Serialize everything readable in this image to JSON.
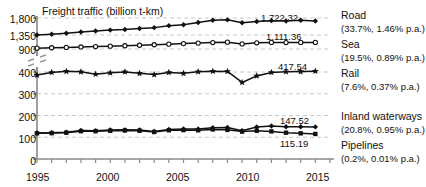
{
  "chart_data": {
    "type": "line",
    "title": "Freight traffic (billion t-km)",
    "xlabel": "",
    "ylabel": "",
    "grid": true,
    "legend_position": "right-inline",
    "axis_break": true,
    "axis_break_note": "broken y-axis between 400 and 900",
    "x": [
      1995,
      1996,
      1997,
      1998,
      1999,
      2000,
      2001,
      2002,
      2003,
      2004,
      2005,
      2006,
      2007,
      2008,
      2009,
      2010,
      2011,
      2012,
      2013,
      2014
    ],
    "xticks_labeled": [
      "1995",
      "2000",
      "2005",
      "2010",
      "2015"
    ],
    "xlim": [
      1995,
      2015
    ],
    "yticks_labeled": [
      "1,800",
      "1,350",
      "900",
      "400",
      "300",
      "200",
      "100",
      "0"
    ],
    "series": [
      {
        "name": "Road",
        "marker": "filled-diamond",
        "end_value": "1,722.32",
        "share": "33.7%",
        "growth": "1.46% p.a.",
        "annotation": "(33.7%, 1.46% p.a.)",
        "values": [
          1348,
          1369,
          1396,
          1428,
          1455,
          1480,
          1497,
          1524,
          1545,
          1597,
          1621,
          1679,
          1742,
          1751,
          1676,
          1708,
          1730,
          1722,
          1740,
          1722.32
        ]
      },
      {
        "name": "Sea",
        "marker": "open-circle",
        "end_value": "1,111.36",
        "share": "19.5%",
        "growth": "0.89% p.a.",
        "annotation": "(19.5%, 0.89% p.a.)",
        "values": [
          928,
          940,
          952,
          966,
          978,
          992,
          1005,
          1020,
          1037,
          1056,
          1074,
          1090,
          1108,
          1120,
          1064,
          1100,
          1112,
          1108,
          1112,
          1111.36
        ]
      },
      {
        "name": "Rail",
        "marker": "filled-star",
        "end_value": "417.54",
        "share": "7.6%",
        "growth": "0.37% p.a.",
        "annotation": "(7.6%, 0.37% p.a.)",
        "values": [
          386,
          398,
          414,
          404,
          390,
          396,
          402,
          394,
          388,
          398,
          394,
          406,
          416,
          412,
          352,
          382,
          398,
          405,
          410,
          417.54
        ]
      },
      {
        "name": "Inland waterways",
        "marker": "filled-diamond",
        "end_value": "147.52",
        "share": "20.8%",
        "growth": "0.95% p.a.",
        "annotation": "(20.8%, 0.95% p.a.)",
        "values": [
          120,
          121,
          123,
          131,
          130,
          133,
          134,
          133,
          127,
          136,
          138,
          138,
          144,
          145,
          130,
          147,
          152,
          148,
          148,
          147.52
        ]
      },
      {
        "name": "Pipelines",
        "marker": "filled-square",
        "end_value": "115.19",
        "share": "0.2%",
        "growth": "0.01% p.a.",
        "annotation": "(0.2%, 0.01% p.a.)",
        "values": [
          118,
          119,
          121,
          128,
          128,
          130,
          131,
          130,
          124,
          132,
          133,
          132,
          136,
          134,
          126,
          130,
          127,
          121,
          118,
          115.19
        ]
      }
    ]
  }
}
